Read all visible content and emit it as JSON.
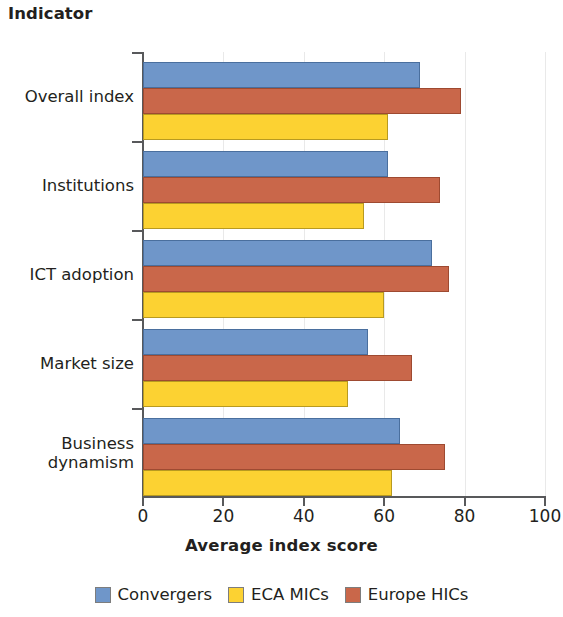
{
  "header": {
    "indicator_title": "Indicator"
  },
  "axis": {
    "x_title": "Average index score",
    "x_ticks": [
      "0",
      "20",
      "40",
      "60",
      "80",
      "100"
    ]
  },
  "legend": {
    "items": [
      {
        "label": "Convergers",
        "color": "#6f96c9",
        "series_key": "convergers"
      },
      {
        "label": "ECA MICs",
        "color": "#fcd232",
        "series_key": "eca_mics"
      },
      {
        "label": "Europe HICs",
        "color": "#c9674a",
        "series_key": "europe_hics"
      }
    ]
  },
  "chart_data": {
    "type": "bar",
    "orientation": "horizontal",
    "title": "",
    "xlabel": "Average index score",
    "ylabel": "Indicator",
    "xlim": [
      0,
      100
    ],
    "grid": true,
    "legend_position": "bottom",
    "categories": [
      "Overall index",
      "Institutions",
      "ICT adoption",
      "Market size",
      "Business dynamism"
    ],
    "series": [
      {
        "name": "Convergers",
        "color": "#6f96c9",
        "values": [
          69,
          61,
          72,
          56,
          64
        ]
      },
      {
        "name": "Europe HICs",
        "color": "#c9674a",
        "values": [
          79,
          74,
          76,
          67,
          75
        ]
      },
      {
        "name": "ECA MICs",
        "color": "#fcd232",
        "values": [
          61,
          55,
          60,
          51,
          62
        ]
      }
    ],
    "series_draw_order": [
      "Convergers",
      "Europe HICs",
      "ECA MICs"
    ]
  }
}
